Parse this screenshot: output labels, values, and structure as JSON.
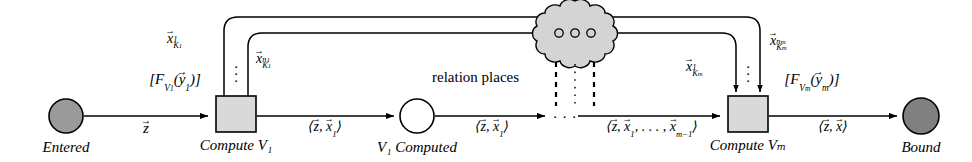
{
  "figure": {
    "kind": "petri-net-diagram",
    "background": "#ffffff",
    "stroke": "#000000",
    "colors": {
      "place_entered_fill": "#9a9a9a",
      "place_bound_fill": "#808080",
      "place_computed_fill": "#ffffff",
      "transition_fill": "#d9d9d9",
      "cloud_fill": "#d4d4d4",
      "line": "#000000"
    }
  },
  "places": [
    {
      "id": "entered",
      "label": "Entered",
      "style": "filled-gray",
      "cx": 66,
      "cy": 116,
      "r": 17
    },
    {
      "id": "computed",
      "label": "V₁ Computed",
      "style": "hollow",
      "cx": 417,
      "cy": 116,
      "r": 17
    },
    {
      "id": "bound",
      "label": "Bound",
      "style": "filled-dark",
      "cx": 921,
      "cy": 116,
      "r": 18
    }
  ],
  "transitions": [
    {
      "id": "compute_v1",
      "label": "Compute V₁",
      "x": 216,
      "y": 96,
      "w": 40,
      "h": 36
    },
    {
      "id": "compute_vm",
      "label": "Compute Vₘ",
      "x": 728,
      "y": 96,
      "w": 40,
      "h": 36
    }
  ],
  "cloud": {
    "id": "relation_places",
    "label": "relation places",
    "inner_dots": 3,
    "cx": 575,
    "cy": 30,
    "r": 30
  },
  "arc_labels": {
    "entered_to_v1": "z⃗",
    "v1_to_computed": "⟨z⃗, x⃗₁⟩",
    "computed_to_gap": "⟨z⃗, x⃗₁⟩",
    "gap_to_vm": "⟨z⃗, x⃗₁, … , x⃗ₘ₋₁⟩",
    "vm_to_bound": "⟨z⃗, x⃗⟩"
  },
  "guard_labels": {
    "v1": "[Fᵥ₁(y⃗₁)]",
    "vm": "[Fᵥₘ(y⃗ₘ)]"
  },
  "output_labels": {
    "v1_first": "x⃗_{K₁¹}",
    "v1_last": "x⃗_{K₁^{n₁}}",
    "vm_first": "x⃗_{Kₘ¹}",
    "vm_last": "x⃗_{Kₘ^{nₘ}}"
  },
  "ellipses": {
    "horizontal_gap": "⋯",
    "vertical_v1": "⋮",
    "vertical_vm": "⋮",
    "cloud_column": "⋮"
  }
}
